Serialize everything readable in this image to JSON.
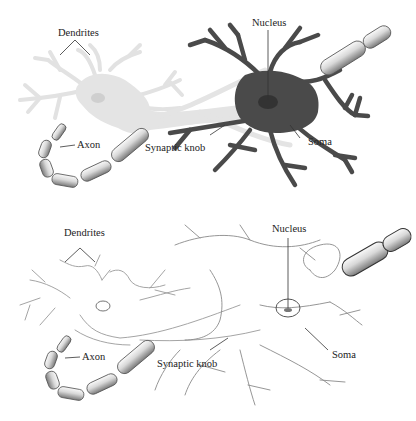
{
  "figure": {
    "colors": {
      "light_neuron_fill": "#e4e4e4",
      "dark_neuron_fill": "#4a4a4a",
      "outline_stroke": "#8c8c8c",
      "myelin_light": "#f2f2f2",
      "myelin_dark": "#6a6a6a",
      "label_text": "#222222",
      "leader_line": "#333333"
    }
  },
  "panels": [
    {
      "id": "shaded",
      "labels": {
        "dendrites": "Dendrites",
        "nucleus": "Nucleus",
        "axon": "Axon",
        "synaptic_knob": "Synaptic knob",
        "soma": "Soma"
      }
    },
    {
      "id": "outline",
      "labels": {
        "dendrites": "Dendrites",
        "nucleus": "Nucleus",
        "axon": "Axon",
        "synaptic_knob": "Synaptic knob",
        "soma": "Soma"
      }
    }
  ]
}
